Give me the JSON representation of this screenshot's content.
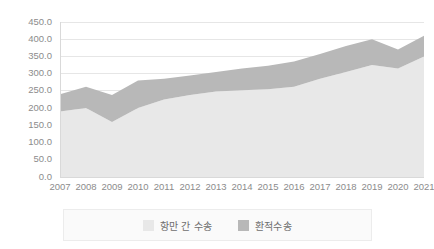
{
  "chart_data": {
    "type": "area",
    "stacked": true,
    "title": "",
    "subtitle": "",
    "xlabel": "",
    "ylabel": "",
    "categories": [
      "2007",
      "2008",
      "2009",
      "2010",
      "2011",
      "2012",
      "2013",
      "2014",
      "2015",
      "2016",
      "2017",
      "2018",
      "2019",
      "2020",
      "2021"
    ],
    "x": [
      2007,
      2008,
      2009,
      2010,
      2011,
      2012,
      2013,
      2014,
      2015,
      2016,
      2017,
      2018,
      2019,
      2020,
      2021
    ],
    "series": [
      {
        "name": "항만 간 수송",
        "color": "#e8e8e8",
        "values": [
          190.0,
          200.0,
          160.0,
          200.0,
          225.0,
          238.0,
          248.0,
          252.0,
          255.0,
          262.0,
          285.0,
          305.0,
          325.0,
          315.0,
          350.0
        ]
      },
      {
        "name": "환적수송",
        "color": "#b8b8b8",
        "values": [
          50.0,
          62.0,
          78.0,
          80.0,
          60.0,
          57.0,
          57.0,
          63.0,
          68.0,
          73.0,
          72.0,
          75.0,
          75.0,
          55.0,
          60.0
        ]
      }
    ],
    "totals": [
      240.0,
      262.0,
      238.0,
      280.0,
      285.0,
      295.0,
      305.0,
      315.0,
      323.0,
      335.0,
      357.0,
      380.0,
      400.0,
      370.0,
      410.0
    ],
    "yticks": [
      "0.0",
      "50.0",
      "100.0",
      "150.0",
      "200.0",
      "250.0",
      "300.0",
      "350.0",
      "400.0",
      "450.0"
    ],
    "ytick_values": [
      0,
      50,
      100,
      150,
      200,
      250,
      300,
      350,
      400,
      450
    ],
    "ylim": [
      0,
      450
    ],
    "grid": true,
    "legend_position": "bottom"
  },
  "legend": {
    "items": [
      {
        "label": "항만 간 수송",
        "color": "#e8e8e8"
      },
      {
        "label": "환적수송",
        "color": "#b8b8b8"
      }
    ]
  }
}
